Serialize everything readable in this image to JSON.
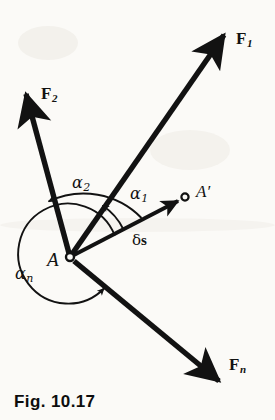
{
  "figure": {
    "caption": "Fig. 10.17",
    "background_color": "#fbfaf7",
    "ink_color": "#121212"
  },
  "geometry": {
    "vertex_A": {
      "x": 70,
      "y": 257
    },
    "point_A_prime": {
      "x": 185,
      "y": 197
    }
  },
  "vectors": [
    {
      "name": "F1",
      "label_text": "F",
      "label_sub": "1",
      "label_x": 236,
      "label_y": 30,
      "tip": {
        "x": 227,
        "y": 30
      },
      "angle_deg_from_east": 61
    },
    {
      "name": "F2",
      "label_text": "F",
      "label_sub": "2",
      "label_x": 41,
      "label_y": 85,
      "tip": {
        "x": 24,
        "y": 88
      },
      "angle_deg_from_east": 105
    },
    {
      "name": "Fn",
      "label_text": "F",
      "label_sub": "n",
      "label_x": 229,
      "label_y": 356,
      "tip": {
        "x": 224,
        "y": 385
      },
      "angle_deg_from_east": -40
    },
    {
      "name": "delta-s",
      "label_text": "δ",
      "label_sub": "s",
      "label_x": 132,
      "label_y": 233,
      "tip": {
        "x": 181,
        "y": 200
      },
      "angle_deg_from_east": 27
    }
  ],
  "angles": [
    {
      "name": "alpha1",
      "symbol": "α",
      "subscript": "1",
      "label_x": 130,
      "label_y": 186,
      "between": [
        "delta-s",
        "F1"
      ],
      "arc_radius": 58
    },
    {
      "name": "alpha2",
      "symbol": "α",
      "subscript": "2",
      "label_x": 72,
      "label_y": 175,
      "between": [
        "delta-s",
        "F2"
      ],
      "arc_radius": 80
    },
    {
      "name": "alphan",
      "symbol": "α",
      "subscript": "n",
      "label_x": 15,
      "label_y": 266,
      "between": [
        "delta-s",
        "Fn"
      ],
      "arc_radius": 50
    }
  ],
  "points": [
    {
      "name": "A",
      "label": "A",
      "label_x": 47,
      "label_y": 250
    },
    {
      "name": "A-prime",
      "label": "A′",
      "label_x": 196,
      "label_y": 183
    }
  ]
}
